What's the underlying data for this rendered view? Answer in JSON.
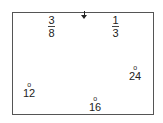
{
  "marker": {
    "icon": "down-arrow-icon"
  },
  "fractions": [
    {
      "numerator": "3",
      "denominator": "8"
    },
    {
      "numerator": "1",
      "denominator": "3"
    }
  ],
  "angles": [
    {
      "symbol": "o",
      "value": "12"
    },
    {
      "symbol": "o",
      "value": "16"
    },
    {
      "symbol": "o",
      "value": "24"
    }
  ]
}
